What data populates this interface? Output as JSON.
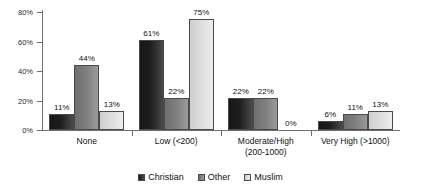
{
  "chart_data": {
    "type": "bar",
    "title": "",
    "subtitle": "",
    "xlabel": "",
    "ylabel": "",
    "ylim": [
      0,
      80
    ],
    "y_ticks": [
      "0%",
      "20%",
      "40%",
      "60%",
      "80%"
    ],
    "y_tick_values": [
      0,
      20,
      40,
      60,
      80
    ],
    "grid": false,
    "legend_position": "bottom",
    "categories": [
      "None",
      "Low (<200)",
      "Moderate/High (200-1000)",
      "Very High (>1000)"
    ],
    "category_lines": [
      [
        "None"
      ],
      [
        "Low (<200)"
      ],
      [
        "Moderate/High",
        "(200-1000)"
      ],
      [
        "Very High (>1000)"
      ]
    ],
    "series": [
      {
        "name": "Christian",
        "color": "#1d1d1d",
        "values": [
          11,
          61,
          22,
          6
        ],
        "labels": [
          "11%",
          "61%",
          "22%",
          "6%"
        ]
      },
      {
        "name": "Other",
        "color": "#7d7d7d",
        "values": [
          44,
          22,
          22,
          11
        ],
        "labels": [
          "44%",
          "22%",
          "22%",
          "11%"
        ]
      },
      {
        "name": "Muslim",
        "color": "#dcdcdc",
        "values": [
          13,
          75,
          0,
          13
        ],
        "labels": [
          "13%",
          "75%",
          "0%",
          "13%"
        ]
      }
    ],
    "legend": [
      {
        "label": "Christian",
        "swatch": "christian"
      },
      {
        "label": "Other",
        "swatch": "other"
      },
      {
        "label": "Muslim",
        "swatch": "muslim"
      }
    ]
  }
}
